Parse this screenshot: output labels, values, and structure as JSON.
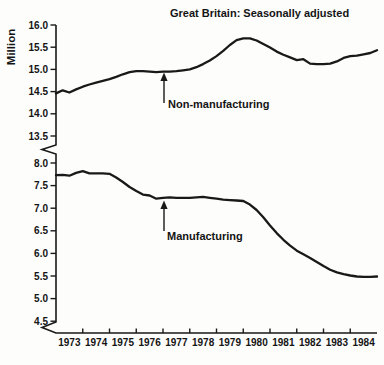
{
  "figure": {
    "title": "Great Britain: Seasonally adjusted",
    "y_axis_label": "Million"
  },
  "chart_data": {
    "type": "line",
    "title": "Great Britain: Seasonally adjusted",
    "xlabel": "",
    "ylabel": "Million",
    "grid": false,
    "legend": "none (inline arrow annotations)",
    "x_tick_labels": [
      "1973",
      "1974",
      "1975",
      "1976",
      "1977",
      "1978",
      "1979",
      "1980",
      "1981",
      "1982",
      "1983",
      "1984"
    ],
    "y_axis": {
      "broken": true,
      "upper_segment": {
        "range": [
          13.5,
          16.0
        ],
        "tick_labels": [
          "16.0",
          "15.5",
          "15.0",
          "14.5",
          "14.0",
          "13.5"
        ],
        "ticks": [
          16.0,
          15.5,
          15.0,
          14.5,
          14.0,
          13.5
        ]
      },
      "lower_segment": {
        "range": [
          4.5,
          8.0
        ],
        "tick_labels": [
          "8.0",
          "7.5",
          "7.0",
          "6.5",
          "6.0",
          "5.5",
          "5.0",
          "4.5"
        ],
        "ticks": [
          8.0,
          7.5,
          7.0,
          6.5,
          6.0,
          5.5,
          5.0,
          4.5
        ]
      }
    },
    "x": [
      1973,
      1973.25,
      1973.5,
      1973.75,
      1974,
      1974.25,
      1974.5,
      1974.75,
      1975,
      1975.25,
      1975.5,
      1975.75,
      1976,
      1976.25,
      1976.5,
      1976.75,
      1977,
      1977.25,
      1977.5,
      1977.75,
      1978,
      1978.25,
      1978.5,
      1978.75,
      1979,
      1979.25,
      1979.5,
      1979.75,
      1980,
      1980.25,
      1980.5,
      1980.75,
      1981,
      1981.25,
      1981.5,
      1981.75,
      1982,
      1982.25,
      1982.5,
      1982.75,
      1983,
      1983.25,
      1983.5,
      1983.75,
      1984,
      1984.25,
      1984.5,
      1984.75,
      1985
    ],
    "series": [
      {
        "name": "non-manufacturing",
        "label": "Non-manufacturing",
        "annotation_arrow_at_x": 1977,
        "values": [
          14.46,
          14.53,
          14.48,
          14.55,
          14.61,
          14.66,
          14.7,
          14.74,
          14.78,
          14.83,
          14.89,
          14.94,
          14.96,
          14.96,
          14.95,
          14.94,
          14.95,
          14.95,
          14.96,
          14.98,
          15.0,
          15.05,
          15.12,
          15.2,
          15.3,
          15.42,
          15.55,
          15.66,
          15.7,
          15.7,
          15.65,
          15.57,
          15.49,
          15.4,
          15.33,
          15.27,
          15.21,
          15.23,
          15.13,
          15.12,
          15.12,
          15.13,
          15.18,
          15.26,
          15.3,
          15.31,
          15.34,
          15.37,
          15.43
        ]
      },
      {
        "name": "manufacturing",
        "label": "Manufacturing",
        "annotation_arrow_at_x": 1977,
        "values": [
          7.73,
          7.74,
          7.72,
          7.78,
          7.82,
          7.77,
          7.77,
          7.77,
          7.76,
          7.68,
          7.58,
          7.47,
          7.38,
          7.3,
          7.28,
          7.21,
          7.23,
          7.24,
          7.23,
          7.23,
          7.23,
          7.24,
          7.25,
          7.23,
          7.21,
          7.19,
          7.18,
          7.17,
          7.16,
          7.08,
          6.96,
          6.8,
          6.62,
          6.45,
          6.3,
          6.17,
          6.06,
          5.98,
          5.9,
          5.81,
          5.72,
          5.64,
          5.58,
          5.54,
          5.51,
          5.49,
          5.48,
          5.48,
          5.49
        ]
      }
    ],
    "colors": {
      "line": "#191919",
      "text": "#141414",
      "background": "#fdfdfb"
    }
  }
}
